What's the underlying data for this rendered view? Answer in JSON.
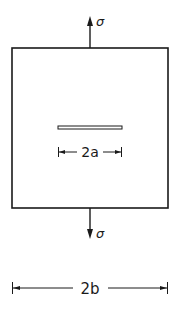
{
  "diagram": {
    "colors": {
      "stroke": "#1a1a1a",
      "background": "#ffffff"
    },
    "labels": {
      "stress_top": "σ",
      "stress_bottom": "σ",
      "crack_length": "2a",
      "plate_width": "2b"
    },
    "elements": {
      "plate": {
        "x": 12,
        "y": 48,
        "width": 156,
        "height": 160
      },
      "crack": {
        "x1": 58,
        "x2": 122,
        "y": 127.5,
        "thickness": 3
      },
      "top_arrow": {
        "x": 90,
        "y_from": 48,
        "y_to": 16,
        "direction": "up"
      },
      "bottom_arrow": {
        "x": 90,
        "y_from": 208,
        "y_to": 238,
        "direction": "down"
      },
      "dim_2a": {
        "x1": 58,
        "x2": 122,
        "y": 152
      },
      "dim_2b": {
        "x1": 12,
        "x2": 168,
        "y": 288
      }
    }
  }
}
